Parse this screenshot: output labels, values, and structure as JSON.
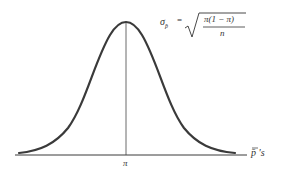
{
  "diagram": {
    "type": "normal-distribution-curve",
    "formula": {
      "lhs": "σ",
      "lhs_subscript": "p̄",
      "equals": "=",
      "numerator": "π(1 − π)",
      "denominator": "n"
    },
    "center_label": "π",
    "axis_label": "p̄ 's",
    "colors": {
      "curve": "#3a3a3a",
      "axis": "#3a3a3a",
      "text": "#333333"
    }
  }
}
